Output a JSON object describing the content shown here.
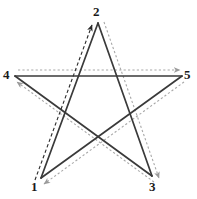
{
  "figure": {
    "name": "pentagram-construction-diagram",
    "canvas": {
      "width": 197,
      "height": 199,
      "background": "#ffffff"
    },
    "colors": {
      "solid_stroke": "#3a3a3a",
      "dotted_guide": "#a8a8a8",
      "dashed_guide": "#2a2a2a",
      "label_color": "#1a1a1a"
    },
    "vertices": [
      {
        "id": "v1",
        "label": "1",
        "x": 41,
        "y": 178,
        "label_x": 31,
        "label_y": 180
      },
      {
        "id": "v2",
        "label": "2",
        "x": 98,
        "y": 23,
        "label_x": 93,
        "label_y": 5
      },
      {
        "id": "v3",
        "label": "3",
        "x": 152,
        "y": 176,
        "label_x": 149,
        "label_y": 180
      },
      {
        "id": "v4",
        "label": "4",
        "x": 15,
        "y": 76,
        "label_x": 3,
        "label_y": 68
      },
      {
        "id": "v5",
        "label": "5",
        "x": 182,
        "y": 76,
        "label_x": 184,
        "label_y": 68
      }
    ],
    "solid_edges": [
      {
        "from": "1",
        "to": "2",
        "x1": 41,
        "y1": 178,
        "x2": 98,
        "y2": 23
      },
      {
        "from": "2",
        "to": "3",
        "x1": 98,
        "y1": 23,
        "x2": 152,
        "y2": 176
      },
      {
        "from": "3",
        "to": "4",
        "x1": 152,
        "y1": 176,
        "x2": 15,
        "y2": 76
      },
      {
        "from": "4",
        "to": "5",
        "x1": 15,
        "y1": 76,
        "x2": 182,
        "y2": 76
      },
      {
        "from": "5",
        "to": "1",
        "x1": 182,
        "y1": 76,
        "x2": 41,
        "y2": 178
      }
    ],
    "guide_arrows": [
      {
        "from": "1",
        "to": "2",
        "style": "dashed",
        "color": "#2a2a2a",
        "x1": 35,
        "y1": 180,
        "x2": 92,
        "y2": 25,
        "arrow_at": "2"
      },
      {
        "from": "2",
        "to": "3",
        "style": "dotted",
        "color": "#a8a8a8",
        "x1": 104,
        "y1": 22,
        "x2": 159,
        "y2": 178,
        "arrow_at": "3"
      },
      {
        "from": "3",
        "to": "4",
        "style": "dotted",
        "color": "#a8a8a8",
        "x1": 154,
        "y1": 182,
        "x2": 17,
        "y2": 82,
        "arrow_at": "4"
      },
      {
        "from": "4",
        "to": "5",
        "style": "dotted",
        "color": "#a8a8a8",
        "x1": 18,
        "y1": 70,
        "x2": 180,
        "y2": 70,
        "arrow_at": "5"
      },
      {
        "from": "5",
        "to": "1",
        "style": "dotted",
        "color": "#a8a8a8",
        "x1": 184,
        "y1": 82,
        "x2": 44,
        "y2": 184,
        "arrow_at": "1"
      }
    ],
    "draw_order_sequence": "1 → 2 → 3 → 4 → 5 → 1"
  }
}
